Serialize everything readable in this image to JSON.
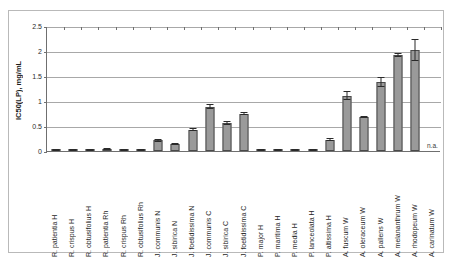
{
  "chart_data": {
    "type": "bar",
    "title": "",
    "xlabel": "",
    "ylabel": "IC50(LP), mg/mL",
    "ylim": [
      0,
      2.5
    ],
    "ytick_labels": [
      "0",
      "0.5",
      "1",
      "1.5",
      "2",
      "2.5"
    ],
    "ytick_values": [
      0,
      0.5,
      1,
      1.5,
      2,
      2.5
    ],
    "grid": true,
    "legend": "none",
    "error_bars": true,
    "categories": [
      "R. patientia H",
      "R. crispus H",
      "R. obtusifolius H",
      "R. patientia Rh",
      "R. crispus Rh",
      "R. obtusifolius Rh",
      "J. communis N",
      "J. sibirica N",
      "J. foetidissima N",
      "J. communis C",
      "J. sibirica C",
      "J. foetidissima C",
      "P. major H",
      "P. maritima H",
      "P. media H",
      "P. lanceolata H",
      "P. altissima H",
      "A. fuscum W",
      "A. oleraceum W",
      "A. pallens W",
      "A. melananthrum W",
      "A. rhodopeum W",
      "A. carinatum W"
    ],
    "values": [
      0.02,
      0.02,
      0.02,
      0.03,
      0.01,
      0.01,
      0.22,
      0.14,
      0.43,
      0.89,
      0.56,
      0.75,
      0.02,
      0.02,
      0.02,
      0.02,
      0.23,
      1.11,
      0.69,
      1.38,
      1.93,
      2.02,
      null
    ],
    "errors": [
      0.01,
      0.01,
      0.01,
      0.01,
      0.01,
      0.01,
      0.03,
      0.02,
      0.03,
      0.05,
      0.04,
      0.03,
      0.01,
      0.01,
      0.01,
      0.01,
      0.03,
      0.09,
      0.02,
      0.1,
      0.04,
      0.22,
      null
    ],
    "not_available_label": "n.a.",
    "not_available_category": "A. carinatum W"
  },
  "colors": {
    "bar_fill": "#9a9a9a",
    "bar_stroke": "#4a4a4a",
    "gridline": "#a8a8a8",
    "axis": "#6f6f6f",
    "text": "#1f1f1f",
    "frame": "#b9b9b9",
    "background": "#ffffff"
  }
}
